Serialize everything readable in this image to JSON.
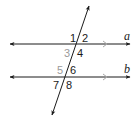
{
  "diagram": {
    "colors": {
      "line": "#1a1a1a",
      "muted_label": "#9a9a9a",
      "parallel_marker": "#a8a8a8"
    },
    "lines": [
      {
        "id": "a",
        "label": "a"
      },
      {
        "id": "b",
        "label": "b"
      }
    ],
    "angles": [
      {
        "n": "1",
        "muted": false
      },
      {
        "n": "2",
        "muted": false
      },
      {
        "n": "3",
        "muted": true
      },
      {
        "n": "4",
        "muted": false
      },
      {
        "n": "5",
        "muted": true
      },
      {
        "n": "6",
        "muted": false
      },
      {
        "n": "7",
        "muted": false
      },
      {
        "n": "8",
        "muted": false
      }
    ]
  }
}
